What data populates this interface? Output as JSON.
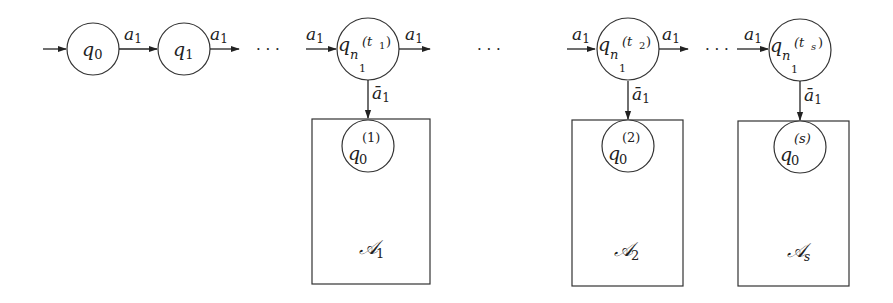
{
  "diagram": {
    "type": "automaton",
    "colors": {
      "stroke": "#222222",
      "background": "#ffffff"
    },
    "chain_states": [
      {
        "id": "q0",
        "base": "q",
        "sub": "0",
        "sup": ""
      },
      {
        "id": "q1",
        "base": "q",
        "sub": "1",
        "sup": ""
      },
      {
        "id": "qt1",
        "base": "q",
        "sub": "n",
        "subsub": "1",
        "sup": "(t",
        "supsub": "1",
        "supclose": ")"
      },
      {
        "id": "qt2",
        "base": "q",
        "sub": "n",
        "subsub": "1",
        "sup": "(t",
        "supsub": "2",
        "supclose": ")"
      },
      {
        "id": "qts",
        "base": "q",
        "sub": "n",
        "subsub": "1",
        "sup": "(t",
        "supsub": "s",
        "supclose": ")"
      }
    ],
    "edge_label": {
      "base": "a",
      "sub": "1"
    },
    "down_edge_label": {
      "base": "ā",
      "sub": "1"
    },
    "ellipsis": "· · ·",
    "sub_automata": [
      {
        "id": "A1",
        "label_base": "𝒜",
        "label_sub": "1",
        "start": {
          "base": "q",
          "sub": "0",
          "sup": "(1)"
        }
      },
      {
        "id": "A2",
        "label_base": "𝒜",
        "label_sub": "2",
        "start": {
          "base": "q",
          "sub": "0",
          "sup": "(2)"
        }
      },
      {
        "id": "As",
        "label_base": "𝒜",
        "label_sub": "s",
        "start": {
          "base": "q",
          "sub": "0",
          "sup": "(s)"
        }
      }
    ]
  }
}
